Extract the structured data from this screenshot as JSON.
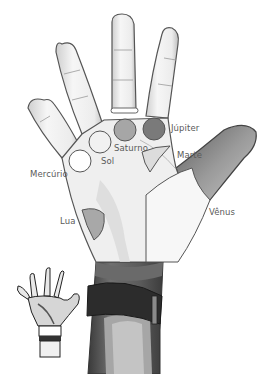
{
  "diagram": {
    "mounts": [
      {
        "id": "jupiter",
        "label": "Júpiter",
        "shape": "circle",
        "fill": "#7a7a7a"
      },
      {
        "id": "saturno",
        "label": "Saturno",
        "shape": "circle",
        "fill": "#a6a6a6"
      },
      {
        "id": "sol",
        "label": "Sol",
        "shape": "circle",
        "fill": "#f1f1f1"
      },
      {
        "id": "mercurio",
        "label": "Mercúrio",
        "shape": "circle",
        "fill": "#ffffff"
      },
      {
        "id": "marte",
        "label": "Marte",
        "shape": "crescent",
        "fill": "#dcdcdc"
      },
      {
        "id": "lua",
        "label": "Lua",
        "shape": "half-oval",
        "fill": "#a8a8a8"
      },
      {
        "id": "venus",
        "label": "Vênus",
        "shape": "region",
        "fill": "#f4f4f4"
      }
    ],
    "colors": {
      "skin_light": "#f3f3f3",
      "skin_shade": "#d2d2d2",
      "outline": "#555555",
      "wrist_dark": "#4a4a4a",
      "strap": "#2b2b2b",
      "label_text": "#5a5a5a"
    }
  }
}
